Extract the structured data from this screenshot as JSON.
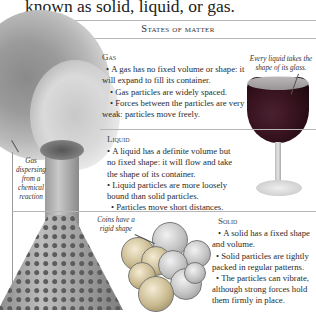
{
  "intro_text": "known as solid, liquid, or gas.",
  "panel": {
    "title": "States of matter"
  },
  "sections": {
    "gas": {
      "heading": "Gas",
      "bullets": [
        "A gas has no fixed volume or shape: it will expand to fill its container.",
        "Gas particles are widely spaced.",
        "Forces between the particles are very weak: particles move freely."
      ]
    },
    "liquid": {
      "heading": "Liquid",
      "bullets": [
        "A liquid has a definite volume but no fixed shape: it will flow and take the shape of its container.",
        "Liquid particles are more loosely bound than solid particles.",
        "Particles move short distances."
      ]
    },
    "solid": {
      "heading": "Solid",
      "bullets": [
        "A solid has a fixed shape and volume.",
        "Solid particles are tightly packed in regular patterns.",
        "The particles can vibrate, although strong forces hold them firmly in place."
      ]
    }
  },
  "captions": {
    "glass": "Every liquid takes the shape of its glass.",
    "gas": "Gas dispersing from a chemical reaction",
    "coins": "Coins have a rigid shape"
  },
  "images": {
    "smoke": "gas-smoke-photo",
    "flask": "flask-photo",
    "wine_glass": "wine-glass-photo",
    "coins": "coins-photo"
  }
}
